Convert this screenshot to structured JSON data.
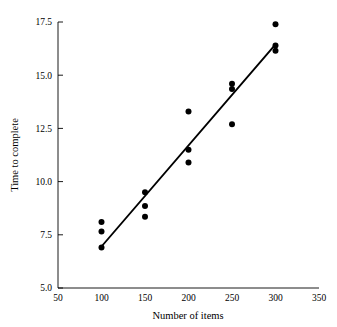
{
  "chart_data": {
    "type": "scatter",
    "title": "",
    "xlabel": "Number of items",
    "ylabel": "Time to complete",
    "xlim": [
      50,
      350
    ],
    "ylim": [
      5.0,
      17.5
    ],
    "xticks": [
      50,
      100,
      150,
      200,
      250,
      300,
      350
    ],
    "yticks": [
      5.0,
      7.5,
      10.0,
      12.5,
      15.0,
      17.5
    ],
    "xtick_labels": [
      "50",
      "100",
      "150",
      "200",
      "250",
      "300",
      "350"
    ],
    "ytick_labels": [
      "5.0",
      "7.5",
      "10.0",
      "12.5",
      "15.0",
      "17.5"
    ],
    "grid": false,
    "legend": false,
    "point_color": "#000000",
    "line_color": "#000000",
    "points": [
      {
        "x": 100,
        "y": 8.1
      },
      {
        "x": 100,
        "y": 7.65
      },
      {
        "x": 100,
        "y": 6.9
      },
      {
        "x": 150,
        "y": 9.5
      },
      {
        "x": 150,
        "y": 8.85
      },
      {
        "x": 150,
        "y": 8.35
      },
      {
        "x": 200,
        "y": 13.3
      },
      {
        "x": 200,
        "y": 11.5
      },
      {
        "x": 200,
        "y": 10.9
      },
      {
        "x": 250,
        "y": 14.6
      },
      {
        "x": 250,
        "y": 14.35
      },
      {
        "x": 250,
        "y": 12.7
      },
      {
        "x": 300,
        "y": 17.4
      },
      {
        "x": 300,
        "y": 16.4
      },
      {
        "x": 300,
        "y": 16.15
      }
    ],
    "fit_line": {
      "name": "regression-line",
      "x0": 100,
      "y0": 6.95,
      "x1": 300,
      "y1": 16.45
    }
  }
}
